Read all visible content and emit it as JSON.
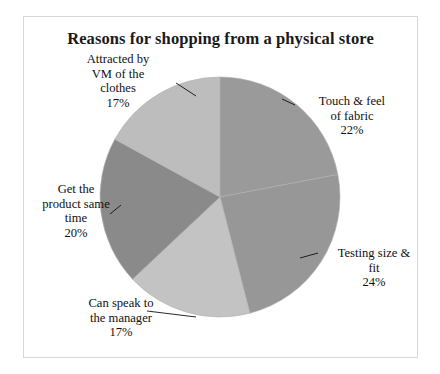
{
  "chart": {
    "title": "Reasons for shopping from a physical store",
    "frame_border_color": "#d8d8d8",
    "background_color": "#ffffff",
    "text_color": "#111111"
  },
  "chart_data": {
    "type": "pie",
    "title": "Reasons for shopping from a physical store",
    "xlabel": "",
    "ylabel": "",
    "legend_position": "none",
    "grid": false,
    "start_angle_deg": 0,
    "direction": "clockwise",
    "center": {
      "x": 220,
      "y": 197
    },
    "radius": 120,
    "categories": [
      "Touch & feel of fabric",
      "Testing size & fit",
      "Can speak to the manager",
      "Get the product same time",
      "Attracted by VM of the clothes"
    ],
    "values": [
      22,
      24,
      17,
      20,
      17
    ],
    "value_labels": [
      "22%",
      "24%",
      "17%",
      "20%",
      "17%"
    ],
    "colors": [
      "#9a9a9a",
      "#979797",
      "#c3c3c3",
      "#8a8a8a",
      "#bdbdbd"
    ],
    "slices": [
      {
        "name": "Touch & feel of fabric",
        "value": 22,
        "percent_label": "22%",
        "color": "#9a9a9a",
        "start_deg": 0,
        "end_deg": 79.2
      },
      {
        "name": "Testing size & fit",
        "value": 24,
        "percent_label": "24%",
        "color": "#979797",
        "start_deg": 79.2,
        "end_deg": 165.6
      },
      {
        "name": "Can speak to the manager",
        "value": 17,
        "percent_label": "17%",
        "color": "#c3c3c3",
        "start_deg": 165.6,
        "end_deg": 226.8
      },
      {
        "name": "Get the product same time",
        "value": 20,
        "percent_label": "20%",
        "color": "#8a8a8a",
        "start_deg": 226.8,
        "end_deg": 298.8
      },
      {
        "name": "Attracted by VM of the clothes",
        "value": 17,
        "percent_label": "17%",
        "color": "#bdbdbd",
        "start_deg": 298.8,
        "end_deg": 360
      }
    ]
  },
  "labels": {
    "attracted": {
      "line1": "Attracted by",
      "line2": "VM of the",
      "line3": "clothes",
      "line4": "17%"
    },
    "touch": {
      "line1": "Touch & feel",
      "line2": "of fabric",
      "line3": "22%"
    },
    "testing": {
      "line1": "Testing size &",
      "line2": "fit",
      "line3": "24%"
    },
    "speak": {
      "line1": "Can speak to",
      "line2": "the manager",
      "line3": "17%"
    },
    "getproduct": {
      "line1": "Get the",
      "line2": "product same",
      "line3": "time",
      "line4": "20%"
    }
  }
}
